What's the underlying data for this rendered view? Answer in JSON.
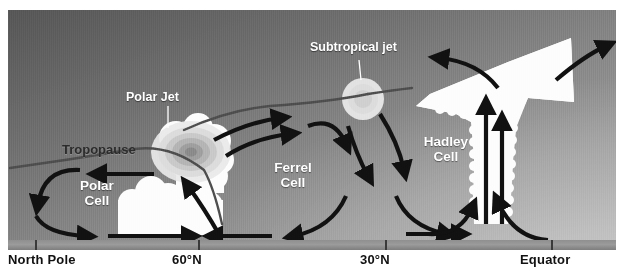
{
  "figure": {
    "type": "diagram"
  },
  "axis": {
    "labels": [
      {
        "text": "North Pole",
        "x_px": 8
      },
      {
        "text": "60°N",
        "x_px": 172
      },
      {
        "text": "30°N",
        "x_px": 360
      },
      {
        "text": "Equator",
        "x_px": 520
      }
    ],
    "ticks_x_px": [
      35,
      198,
      385,
      551
    ]
  },
  "cells": [
    {
      "name": "polar-cell",
      "label": "Polar\nCell",
      "x_px": 62,
      "y_px": 178,
      "color": "#ffffff"
    },
    {
      "name": "ferrel-cell",
      "label": "Ferrel\nCell",
      "x_px": 262,
      "y_px": 160,
      "color": "#ffffff"
    },
    {
      "name": "hadley-cell",
      "label": "Hadley\nCell",
      "x_px": 420,
      "y_px": 135,
      "color": "#ffffff"
    }
  ],
  "features": [
    {
      "name": "tropopause",
      "label": "Tropopause",
      "x_px": 62,
      "y_px": 138,
      "color": "#2b2b2b"
    },
    {
      "name": "polar-jet",
      "label": "Polar Jet",
      "x_px": 153,
      "y_px": 90,
      "color": "#ffffff"
    },
    {
      "name": "subtropical-jet",
      "label": "Subtropical jet",
      "x_px": 313,
      "y_px": 38,
      "color": "#ffffff"
    }
  ],
  "colors": {
    "sky_dark": "#565656",
    "sky_light": "#a6a6a6",
    "ground": "#8f8f8f",
    "arrow": "#111111",
    "cloud": "#fdfdfd",
    "tropopause_line": "#4d4d4d",
    "label_dark": "#111111",
    "label_light": "#ffffff"
  }
}
